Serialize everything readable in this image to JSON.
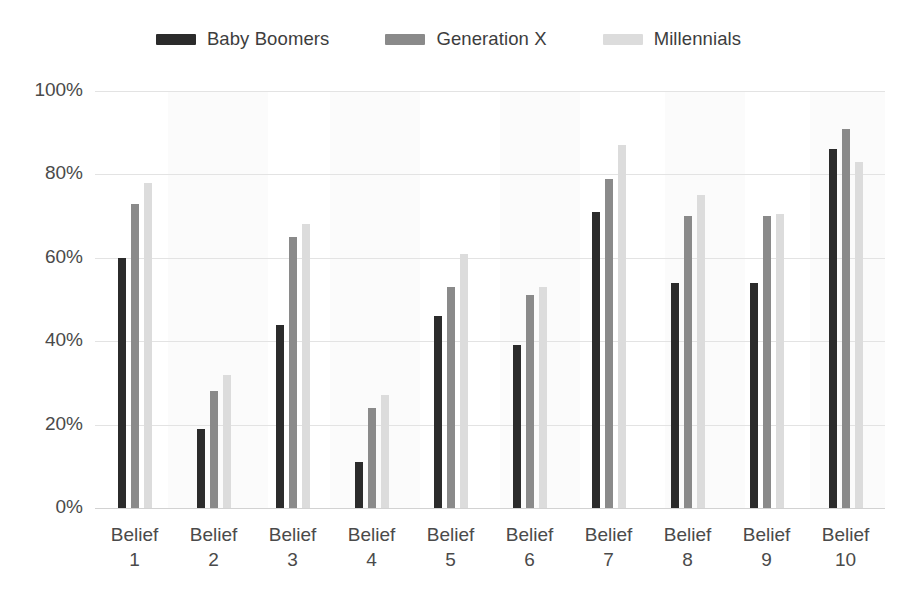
{
  "legend": {
    "items": [
      {
        "label": "Baby Boomers",
        "color": "#2b2b2b",
        "swatch_name": "legend-swatch-baby-boomers"
      },
      {
        "label": "Generation X",
        "color": "#8a8a8a",
        "swatch_name": "legend-swatch-generation-x"
      },
      {
        "label": "Millennials",
        "color": "#dcdcdc",
        "swatch_name": "legend-swatch-millennials"
      }
    ]
  },
  "axes": {
    "y_ticks": [
      "0%",
      "20%",
      "40%",
      "60%",
      "80%",
      "100%"
    ],
    "x_label_prefix": "Belief"
  },
  "chart_data": {
    "type": "bar",
    "title": "",
    "xlabel": "",
    "ylabel": "",
    "ylim": [
      0,
      100
    ],
    "ytick_values": [
      0,
      20,
      40,
      60,
      80,
      100
    ],
    "ytick_labels": [
      "0%",
      "20%",
      "40%",
      "60%",
      "80%",
      "100%"
    ],
    "grid": true,
    "legend_position": "top-center",
    "orientation": "vertical",
    "grouped": true,
    "categories": [
      "Belief 1",
      "Belief 2",
      "Belief 3",
      "Belief 4",
      "Belief 5",
      "Belief 6",
      "Belief 7",
      "Belief 8",
      "Belief 9",
      "Belief 10"
    ],
    "category_lines": [
      [
        "Belief",
        "1"
      ],
      [
        "Belief",
        "2"
      ],
      [
        "Belief",
        "3"
      ],
      [
        "Belief",
        "4"
      ],
      [
        "Belief",
        "5"
      ],
      [
        "Belief",
        "6"
      ],
      [
        "Belief",
        "7"
      ],
      [
        "Belief",
        "8"
      ],
      [
        "Belief",
        "9"
      ],
      [
        "Belief",
        "10"
      ]
    ],
    "series": [
      {
        "name": "Baby Boomers",
        "color": "#2b2b2b",
        "values": [
          60,
          19,
          44,
          11,
          46,
          39,
          71,
          54,
          54,
          86
        ]
      },
      {
        "name": "Generation X",
        "color": "#8a8a8a",
        "values": [
          73,
          28,
          65,
          24,
          53,
          51,
          79,
          70,
          70,
          91
        ]
      },
      {
        "name": "Millennials",
        "color": "#dcdcdc",
        "values": [
          78,
          32,
          68,
          27,
          61,
          53,
          87,
          75,
          70.5,
          83
        ]
      }
    ]
  }
}
